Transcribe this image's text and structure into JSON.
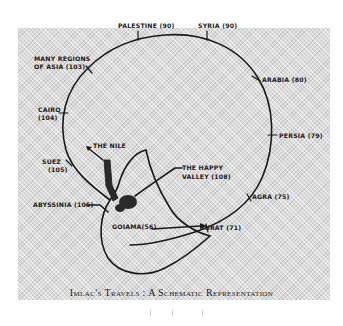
{
  "figure": {
    "caption": "Imlac's Travels : A Schematic Representation",
    "colors": {
      "ink": "#1a1a1a",
      "panel": "#dcdcdc",
      "background": "#ffffff"
    }
  },
  "places": [
    {
      "id": "palestine",
      "label": "PALESTINE (90)"
    },
    {
      "id": "syria",
      "label": "SYRIA (90)"
    },
    {
      "id": "many-regions",
      "label_line1": "MANY REGIONS",
      "label_line2": "OF ASIA (103)"
    },
    {
      "id": "arabia",
      "label": "ARABIA (80)"
    },
    {
      "id": "cairo",
      "label_line1": "CAIRO",
      "label_line2": "(104)"
    },
    {
      "id": "persia",
      "label": "PERSIA (79)"
    },
    {
      "id": "suez",
      "label_line1": "SUEZ",
      "label_line2": "(105)"
    },
    {
      "id": "the-nile",
      "label": "THE NILE"
    },
    {
      "id": "happy-valley",
      "label_line1": "THE HAPPY",
      "label_line2": "VALLEY (108)"
    },
    {
      "id": "abyssinia",
      "label": "ABYSSINIA (105)"
    },
    {
      "id": "agra",
      "label": "AGRA (75)"
    },
    {
      "id": "goiama",
      "label": "GOIAMA(56)"
    },
    {
      "id": "surat",
      "label": "SURAT (71)"
    }
  ]
}
